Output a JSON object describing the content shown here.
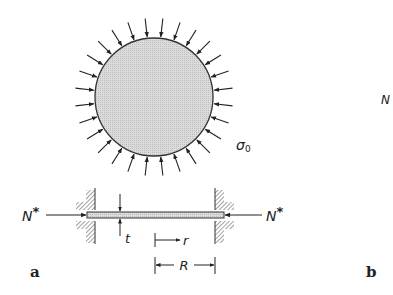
{
  "figure": {
    "panel_a_label": "a",
    "panel_b_label": "b",
    "partial_label_right": "N",
    "circle": {
      "stress_label": "σ",
      "stress_subscript": "0",
      "arrow_count": 28,
      "fill": "#d9d9d9",
      "stroke": "#333333"
    },
    "section": {
      "force_left": "N",
      "force_right": "N",
      "force_superscript": "*",
      "thickness_label": "t",
      "radius_var_label": "r",
      "radius_label": "R"
    }
  }
}
